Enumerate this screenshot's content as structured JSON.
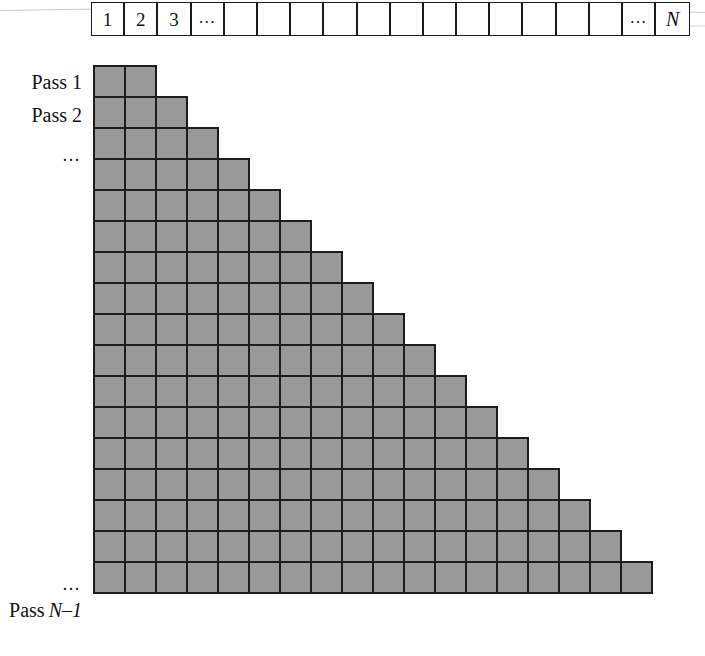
{
  "figure": {
    "type": "sorting-pass-diagram",
    "colors": {
      "cell_fill": "#999999",
      "cell_border": "#1d1d1d",
      "background": "#ffffff",
      "text": "#121212"
    }
  },
  "array_strip": {
    "name": "array-of-n-elements",
    "cell_count": 18,
    "cells": [
      {
        "label": "1"
      },
      {
        "label": "2"
      },
      {
        "label": "3"
      },
      {
        "label": "…",
        "style": "dots"
      },
      {
        "label": ""
      },
      {
        "label": ""
      },
      {
        "label": ""
      },
      {
        "label": ""
      },
      {
        "label": ""
      },
      {
        "label": ""
      },
      {
        "label": ""
      },
      {
        "label": ""
      },
      {
        "label": ""
      },
      {
        "label": ""
      },
      {
        "label": ""
      },
      {
        "label": ""
      },
      {
        "label": "…",
        "style": "dots"
      },
      {
        "label": "N",
        "style": "italic"
      }
    ]
  },
  "pass_labels": [
    {
      "row": 1,
      "text": "Pass 1",
      "italic_part": "",
      "style": "text"
    },
    {
      "row": 2,
      "text": "Pass 2",
      "italic_part": "",
      "style": "text"
    },
    {
      "row": 3,
      "text": "…",
      "italic_part": "",
      "style": "dots"
    },
    {
      "row": 16,
      "text": "…",
      "italic_part": "",
      "style": "dots"
    },
    {
      "row": 17,
      "text": "Pass ",
      "italic_part": "N–1",
      "style": "text"
    }
  ],
  "staircase": {
    "name": "pass-staircase",
    "row_count": 17,
    "cell_size_px": 33,
    "rows": [
      {
        "pass": 1,
        "cells": 2
      },
      {
        "pass": 2,
        "cells": 3
      },
      {
        "pass": 3,
        "cells": 4
      },
      {
        "pass": 4,
        "cells": 5
      },
      {
        "pass": 5,
        "cells": 6
      },
      {
        "pass": 6,
        "cells": 7
      },
      {
        "pass": 7,
        "cells": 8
      },
      {
        "pass": 8,
        "cells": 9
      },
      {
        "pass": 9,
        "cells": 10
      },
      {
        "pass": 10,
        "cells": 11
      },
      {
        "pass": 11,
        "cells": 12
      },
      {
        "pass": 12,
        "cells": 13
      },
      {
        "pass": 13,
        "cells": 14
      },
      {
        "pass": 14,
        "cells": 15
      },
      {
        "pass": 15,
        "cells": 16
      },
      {
        "pass": 16,
        "cells": 17
      },
      {
        "pass": 17,
        "cells": 18
      }
    ]
  }
}
